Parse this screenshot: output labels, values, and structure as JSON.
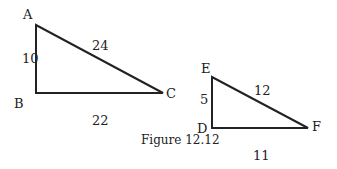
{
  "figure": {
    "caption": "Figure 12.12",
    "triangles": [
      {
        "name": "ABC",
        "vertices": {
          "A": "A",
          "B": "B",
          "C": "C"
        },
        "sides": {
          "AB": "10",
          "AC": "24",
          "BC": "22"
        }
      },
      {
        "name": "DEF",
        "vertices": {
          "D": "D",
          "E": "E",
          "F": "F"
        },
        "sides": {
          "ED": "5",
          "EF": "12",
          "DF": "11"
        }
      }
    ],
    "stroke_color": "#222222"
  }
}
